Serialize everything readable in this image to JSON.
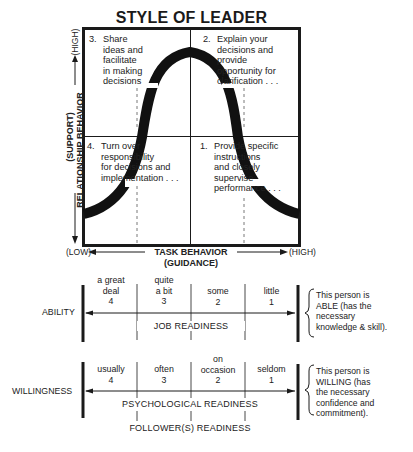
{
  "title": "STYLE OF LEADER",
  "quadrants": [
    {
      "number": "3.",
      "text": "Share\nideas and\nfacilitate\nin making\ndecisions",
      "position": "top-left"
    },
    {
      "number": "2.",
      "text": "Explain your\ndecisions and\nprovide\nopportunity for\nclarification . . .",
      "position": "top-right"
    },
    {
      "number": "4.",
      "text": "Turn over\nresponsibility\nfor decisions and\nimplementation . . .",
      "position": "bottom-left"
    },
    {
      "number": "1.",
      "text": "Provide specific\ninstructions\nand closely\nsupervise\nperformance . . .",
      "position": "bottom-right"
    }
  ],
  "y_axis": {
    "label_line1": "(SUPPORT)",
    "label_line2": "RELATIONSHIP BEHAVIOR",
    "high": "(HIGH)"
  },
  "x_axis": {
    "low": "(LOW)",
    "label_line1": "TASK BEHAVIOR",
    "label_line2": "(GUIDANCE)",
    "high": "(HIGH)"
  },
  "ability": {
    "label": "ABILITY",
    "levels": [
      {
        "text": "a great\ndeal",
        "value": "4"
      },
      {
        "text": "quite\na bit",
        "value": "3"
      },
      {
        "text": "some",
        "value": "2"
      },
      {
        "text": "little",
        "value": "1"
      }
    ],
    "readiness_label": "JOB READINESS",
    "note": "This person is\nABLE (has the\nnecessary\nknowledge & skill)."
  },
  "willingness": {
    "label": "WILLINGNESS",
    "levels": [
      {
        "text": "usually",
        "value": "4"
      },
      {
        "text": "often",
        "value": "3"
      },
      {
        "text": "on\noccasion",
        "value": "2"
      },
      {
        "text": "seldom",
        "value": "1"
      }
    ],
    "readiness_label": "PSYCHOLOGICAL READINESS",
    "note": "This person is\nWILLING (has\nthe necessary\nconfidence and\ncommitment)."
  },
  "footer_label": "FOLLOWER(S) READINESS",
  "colors": {
    "ink": "#1a1a1a",
    "background": "#ffffff"
  }
}
